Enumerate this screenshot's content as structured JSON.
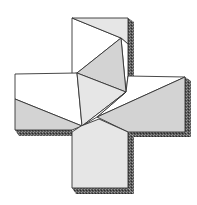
{
  "diagram": {
    "title": "Greek cross dissection puzzle",
    "colors": {
      "face_white": "#ffffff",
      "face_light": "#e6e6e6",
      "face_mid": "#d3d3d3",
      "shadow_dark": "#4a4a4a",
      "outline": "#333333"
    },
    "pieces": [
      {
        "name": "top-arm-white-triangle",
        "fill": "face_white"
      },
      {
        "name": "top-arm-gray-triangle",
        "fill": "face_light"
      },
      {
        "name": "center-square-upper-half",
        "fill": "face_mid"
      },
      {
        "name": "center-square-lower-half",
        "fill": "face_light"
      },
      {
        "name": "left-arm-white-region",
        "fill": "face_white"
      },
      {
        "name": "left-arm-gray-triangle",
        "fill": "face_mid"
      },
      {
        "name": "right-arm-white-region",
        "fill": "face_white"
      },
      {
        "name": "right-arm-gray-triangle",
        "fill": "face_mid"
      },
      {
        "name": "bottom-pentagon",
        "fill": "face_light"
      }
    ]
  }
}
